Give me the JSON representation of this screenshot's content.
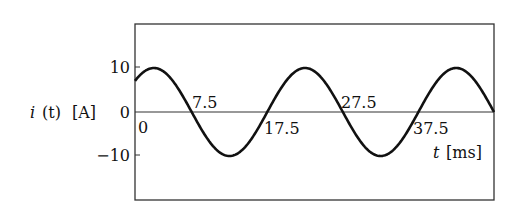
{
  "chart_data": {
    "type": "line",
    "title": "",
    "xlabel": "t [ms]",
    "ylabel": "i (t) [A]",
    "xlim": [
      0,
      47.5
    ],
    "ylim": [
      -18,
      18
    ],
    "yticks": [
      10,
      0,
      -10
    ],
    "ytick_labels": [
      "10",
      "0",
      "−10"
    ],
    "annotations": [
      "0",
      "7.5",
      "17.5",
      "27.5",
      "37.5"
    ],
    "grid": false,
    "series": [
      {
        "name": "i(t)",
        "function": "10*cos(2*pi*(t-2.5)/20)",
        "amplitude": 10,
        "period_ms": 20,
        "zero_crossings": [
          7.5,
          17.5,
          27.5,
          37.5,
          47.5
        ],
        "x": [
          0,
          2.5,
          7.5,
          12.5,
          17.5,
          22.5,
          27.5,
          32.5,
          37.5,
          42.5,
          47.5
        ],
        "values": [
          7.07,
          10,
          0,
          -10,
          0,
          10,
          0,
          -10,
          0,
          10,
          0
        ]
      }
    ]
  },
  "labels": {
    "ylabel_i": "i",
    "ylabel_t": "(t)",
    "ylabel_unit": "[A]",
    "xlabel_t": "t",
    "xlabel_unit": "[ms]",
    "ytick_10": "10",
    "ytick_0": "0",
    "ytick_m10": "−10",
    "x0": "0",
    "x7_5": "7.5",
    "x17_5": "17.5",
    "x27_5": "27.5",
    "x37_5": "37.5"
  }
}
